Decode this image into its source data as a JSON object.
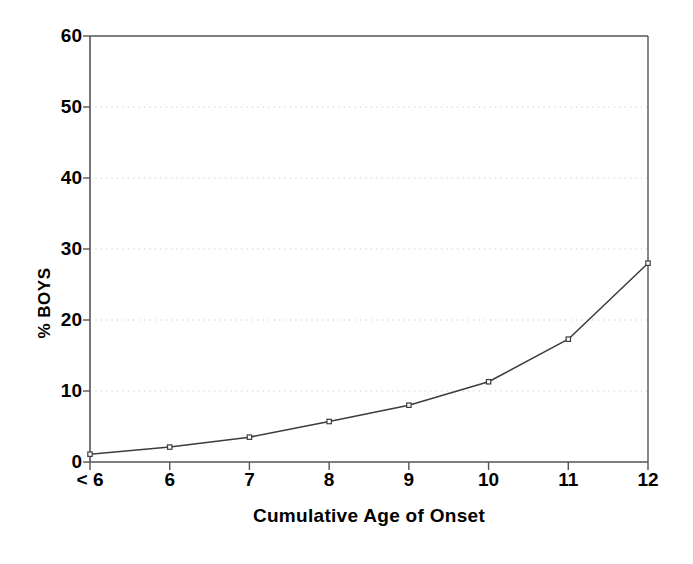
{
  "chart_data": {
    "type": "line",
    "title": "",
    "xlabel": "Cumulative Age of Onset",
    "ylabel": "% BOYS",
    "categories": [
      "< 6",
      "6",
      "7",
      "8",
      "9",
      "10",
      "11",
      "12"
    ],
    "values": [
      1.1,
      2.1,
      3.5,
      5.7,
      8.0,
      11.3,
      17.3,
      28.0
    ],
    "ylim": [
      0,
      60
    ],
    "yticks": [
      0,
      10,
      20,
      30,
      40,
      50,
      60
    ],
    "ytick_labels": [
      "0",
      "10",
      "20",
      "30",
      "40",
      "50",
      "60"
    ],
    "gridlines_at": [
      10,
      20,
      30,
      40,
      50
    ],
    "grid": "horizontal-dotted",
    "legend": "none",
    "marker": "open-square",
    "line_color": "#3c3c3c",
    "grid_color": "#c8c8c8",
    "axis_color": "#555555",
    "text_color": "#000000",
    "background": "#ffffff"
  }
}
